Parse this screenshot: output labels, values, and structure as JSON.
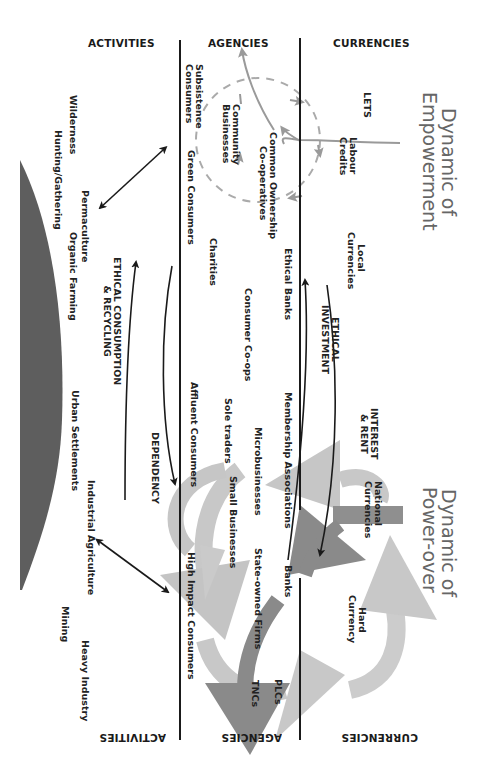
{
  "diagram": {
    "orientation": "rotated 90 degrees clockwise",
    "columns": {
      "top": [
        "ACTIVITIES",
        "AGENCIES",
        "CURRENCIES"
      ],
      "bottom_inverted": [
        "ACTIVITIES",
        "AGENCIES",
        "CURRENCIES"
      ]
    },
    "dynamics": {
      "empowerment": {
        "line1": "Dynamic of",
        "line2": "Empowerment"
      },
      "power_over": {
        "line1": "Dynamic of",
        "line2": "Power-over"
      }
    },
    "currencies": {
      "lets": "LETS",
      "labour_credits_1": "Labour",
      "labour_credits_2": "Credits",
      "local_currencies_1": "Local",
      "local_currencies_2": "Currencies",
      "national_currencies_1": "National",
      "national_currencies_2": "Currencies",
      "hard_currency_1": "Hard",
      "hard_currency_2": "Currency"
    },
    "agencies": {
      "subsistence_1": "Subsistence",
      "subsistence_2": "Consumers",
      "community_1": "Community",
      "community_2": "Businesses",
      "common_ownership_1": "Common Ownership",
      "common_ownership_2": "Co-operatives",
      "green_consumers": "Green Consumers",
      "charities": "Charities",
      "ethical_banks": "Ethical Banks",
      "consumer_coops": "Consumer Co-ops",
      "affluent_consumers": "Affluent Consumers",
      "sole_traders": "Sole traders",
      "membership_associations": "Membership Associations",
      "microbusinesses": "Microbusinesses",
      "small_businesses": "Small Businesses",
      "banks": "Banks",
      "state_owned_firms": "State-owned Firms",
      "high_impact_consumers": "High Impact Consumers",
      "plcs": "PLCs",
      "tncs": "TNCs"
    },
    "activities": {
      "wilderness": "Wilderness",
      "hunting_gathering": "Hunting/Gathering",
      "permaculture": "Permaculture",
      "organic_farming": "Organic Farming",
      "urban_settlements": "Urban Settlements",
      "industrial_agriculture": "Industrial Agriculture",
      "mining": "Mining",
      "heavy_industry": "Heavy Industry"
    },
    "flows": {
      "ethical_investment_1": "ETHICAL",
      "ethical_investment_2": "INVESTMENT",
      "interest_rent_1": "INTEREST",
      "interest_rent_2": "& RENT",
      "ethical_consumption_1": "ETHICAL CONSUMPTION",
      "ethical_consumption_2": "& RECYCLING",
      "dependency": "DEPENDENCY"
    },
    "colors": {
      "line": "#1a1a1a",
      "arrow_light": "#c4c4c4",
      "arrow_mid": "#a8a8a8",
      "arrow_dark": "#8a8a8a",
      "dashed": "#aaaaaa",
      "hump": "#5e5e5e",
      "dynamic_text": "#666666"
    }
  }
}
